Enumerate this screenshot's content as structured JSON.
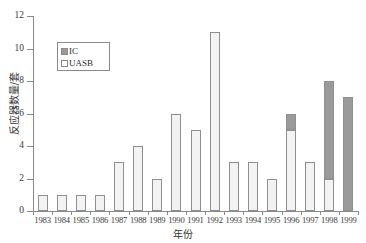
{
  "chart_data": {
    "type": "bar",
    "stacked": true,
    "title": "",
    "xlabel": "年份",
    "ylabel": "反应器数量/套",
    "categories": [
      "1983",
      "1984",
      "1985",
      "1986",
      "1987",
      "1988",
      "1989",
      "1990",
      "1991",
      "1992",
      "1993",
      "1994",
      "1995",
      "1996",
      "1997",
      "1998",
      "1999"
    ],
    "series": [
      {
        "name": "UASB",
        "color": "#f3f3f3",
        "values": [
          1,
          1,
          1,
          1,
          3,
          4,
          2,
          6,
          5,
          11,
          3,
          3,
          2,
          5,
          3,
          2,
          0
        ]
      },
      {
        "name": "IC",
        "color": "#9a9a9a",
        "values": [
          0,
          0,
          0,
          0,
          0,
          0,
          0,
          0,
          0,
          0,
          0,
          0,
          0,
          1,
          0,
          6,
          7
        ]
      }
    ],
    "totals": [
      1,
      1,
      1,
      1,
      3,
      4,
      2,
      6,
      5,
      11,
      3,
      3,
      2,
      6,
      3,
      8,
      7
    ],
    "ylim": [
      0,
      12
    ],
    "y_ticks": [
      0,
      2,
      4,
      6,
      8,
      10,
      12
    ],
    "y_tick_labels": [
      "0",
      "2",
      "4",
      "6",
      "8",
      "10",
      "12"
    ],
    "grid": false,
    "legend_position": "upper-left",
    "legend_entries": [
      {
        "label": "IC",
        "swatch": "dark-gray-square"
      },
      {
        "label": "UASB",
        "swatch": "white-square"
      }
    ]
  }
}
